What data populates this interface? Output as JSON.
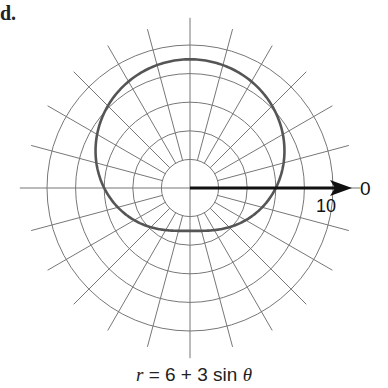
{
  "part_label": "d.",
  "caption": {
    "lhs": "r",
    "rhs": " = 6 + 3 sin ",
    "theta": "θ"
  },
  "axis": {
    "zero_label": "0",
    "ten_label": "10"
  },
  "grid": {
    "center": [
      190,
      188
    ],
    "px_per_unit": 14.3,
    "circle_radii": [
      2,
      4,
      6,
      8,
      10
    ],
    "spoke_step_deg": 15,
    "spoke_outer": 11.5,
    "spoke_inner": 2
  },
  "curve": {
    "equation": "r = 6 + 3 sin θ",
    "a": 6,
    "b": 3,
    "color": "#555555"
  },
  "colors": {
    "grid": "#777777",
    "axis": "#111111"
  }
}
